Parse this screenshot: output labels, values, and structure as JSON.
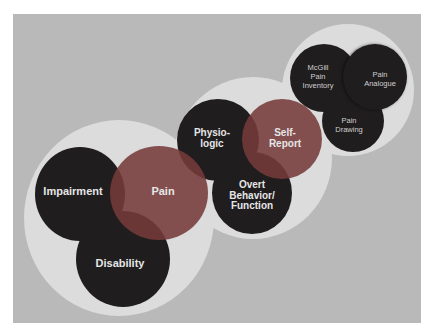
{
  "diagram": {
    "groups": [
      {
        "name": "Conceptual Model",
        "circles": [
          {
            "label": "Impairment",
            "type": "dark"
          },
          {
            "label": "Pain",
            "type": "highlight"
          },
          {
            "label": "Disability",
            "type": "dark"
          }
        ]
      },
      {
        "name": "Assessment Domains",
        "circles": [
          {
            "label": "Physio-\nlogic",
            "type": "dark"
          },
          {
            "label": "Self-\nReport",
            "type": "highlight"
          },
          {
            "label": "Overt\nBehavior/\nFunction",
            "type": "dark"
          }
        ]
      },
      {
        "name": "Self-Report Instruments",
        "circles": [
          {
            "label": "McGill\nPain\nInventory",
            "type": "dark"
          },
          {
            "label": "Pain\nAnalogue",
            "type": "dark"
          },
          {
            "label": "Pain\nDrawing",
            "type": "dark"
          }
        ]
      }
    ],
    "colors": {
      "background": "#b9b9b9",
      "halo": "#dcdcdc",
      "dark_circle": "#1f1d1e",
      "highlight_circle": "#763a3a",
      "text": "#e6e6e6"
    }
  }
}
